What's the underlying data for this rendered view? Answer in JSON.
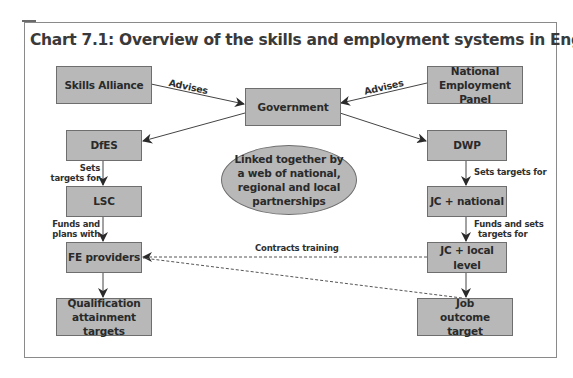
{
  "title": "Chart 7.1: Overview of the skills and employment systems in England",
  "colors": {
    "node_fill": "#b8b8b8",
    "node_border": "#6e6e6e",
    "edge": "#333333",
    "frame": "#8a8a8a"
  },
  "nodes": {
    "skills_alliance": {
      "label": "Skills Alliance",
      "shape": "box"
    },
    "government": {
      "label": "Government",
      "shape": "box"
    },
    "national_employment_panel": {
      "label": "National Employment Panel",
      "shape": "box"
    },
    "dfes": {
      "label": "DfES",
      "shape": "box"
    },
    "dwp": {
      "label": "DWP",
      "shape": "box"
    },
    "partnerships": {
      "label": "Linked together by a web of national, regional and local partnerships",
      "shape": "ellipse"
    },
    "lsc": {
      "label": "LSC",
      "shape": "box"
    },
    "jc_national": {
      "label": "JC + national",
      "shape": "box"
    },
    "fe_providers": {
      "label": "FE providers",
      "shape": "box"
    },
    "jc_local": {
      "label": "JC + local level",
      "shape": "box"
    },
    "qualification_targets": {
      "label": "Qualification attainment targets",
      "shape": "box"
    },
    "job_outcome_target": {
      "label": "Job outcome target",
      "shape": "box"
    }
  },
  "edges": [
    {
      "from": "Skills Alliance",
      "to": "Government",
      "label": "Advises",
      "style": "solid"
    },
    {
      "from": "National Employment Panel",
      "to": "Government",
      "label": "Advises",
      "style": "solid"
    },
    {
      "from": "Government",
      "to": "DfES",
      "label": "",
      "style": "solid"
    },
    {
      "from": "Government",
      "to": "DWP",
      "label": "",
      "style": "solid"
    },
    {
      "from": "DfES",
      "to": "LSC",
      "label": "Sets targets for",
      "style": "solid"
    },
    {
      "from": "LSC",
      "to": "FE providers",
      "label": "Funds and plans with",
      "style": "solid"
    },
    {
      "from": "FE providers",
      "to": "Qualification attainment targets",
      "label": "",
      "style": "solid"
    },
    {
      "from": "DWP",
      "to": "JC + national",
      "label": "Sets targets for",
      "style": "solid"
    },
    {
      "from": "JC + national",
      "to": "JC + local level",
      "label": "Funds and sets targets for",
      "style": "solid"
    },
    {
      "from": "JC + local level",
      "to": "Job outcome target",
      "label": "",
      "style": "solid"
    },
    {
      "from": "JC + local level",
      "to": "FE providers",
      "label": "Contracts training",
      "style": "dashed"
    },
    {
      "from": "Job outcome target",
      "to": "FE providers",
      "label": "",
      "style": "dashed"
    }
  ],
  "labels": {
    "advises_left": "Advises",
    "advises_right": "Advises",
    "dfes_lsc_line1": "Sets",
    "dfes_lsc_line2": "targets for",
    "lsc_fe_line1": "Funds and",
    "lsc_fe_line2": "plans with",
    "dwp_jc": "Sets targets for",
    "jc_jc_line1": "Funds and sets",
    "jc_jc_line2": "targets for",
    "contracts": "Contracts training"
  }
}
